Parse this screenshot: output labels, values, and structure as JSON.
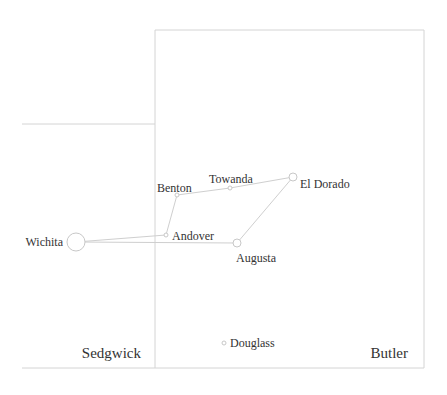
{
  "map": {
    "counties": [
      {
        "name": "Sedgwick",
        "label_x": 141,
        "label_y": 358,
        "anchor": "end"
      },
      {
        "name": "Butler",
        "label_x": 408,
        "label_y": 358,
        "anchor": "end"
      }
    ],
    "cities": [
      {
        "name": "Wichita",
        "x": 76,
        "y": 242,
        "r": 9,
        "label_x": 63,
        "label_y": 246,
        "anchor": "end"
      },
      {
        "name": "Andover",
        "x": 166,
        "y": 235,
        "r": 2,
        "label_x": 172,
        "label_y": 240,
        "anchor": "start"
      },
      {
        "name": "Augusta",
        "x": 237,
        "y": 243,
        "r": 4,
        "label_x": 236,
        "label_y": 262,
        "anchor": "start"
      },
      {
        "name": "Benton",
        "x": 177,
        "y": 195,
        "r": 2,
        "label_x": 157,
        "label_y": 192,
        "anchor": "start"
      },
      {
        "name": "Towanda",
        "x": 230,
        "y": 188,
        "r": 2,
        "label_x": 209,
        "label_y": 183,
        "anchor": "start"
      },
      {
        "name": "El Dorado",
        "x": 293,
        "y": 177,
        "r": 4,
        "label_x": 300,
        "label_y": 188,
        "anchor": "start"
      },
      {
        "name": "Douglass",
        "x": 224,
        "y": 343,
        "r": 2,
        "label_x": 230,
        "label_y": 347,
        "anchor": "start"
      }
    ],
    "roads": [
      {
        "from": "Wichita",
        "to": "Andover"
      },
      {
        "from": "Wichita",
        "to": "Augusta"
      },
      {
        "from": "Andover",
        "to": "Benton"
      },
      {
        "from": "Benton",
        "to": "Towanda"
      },
      {
        "from": "Towanda",
        "to": "El Dorado"
      },
      {
        "from": "El Dorado",
        "to": "Augusta"
      }
    ]
  }
}
